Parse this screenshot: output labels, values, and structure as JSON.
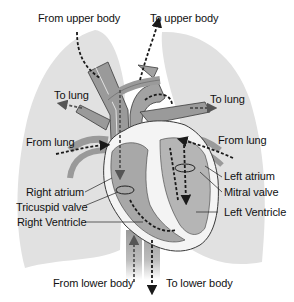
{
  "diagram": {
    "title": "",
    "colors": {
      "background": "#ffffff",
      "lung": "#e1e1e1",
      "vessel": "#9a9a9a",
      "heart_chamber": "#a8a8a8",
      "heart_wall": "#f4f4f4",
      "outline": "#3a3a3a",
      "arrow": "#1a1a1a",
      "text": "#111111"
    },
    "labels": {
      "from_upper_body": "From upper body",
      "to_upper_body": "To upper body",
      "to_lung_left": "To lung",
      "to_lung_right": "To lung",
      "from_lung_left": "From lung",
      "from_lung_right": "From lung",
      "right_atrium": "Right atrium",
      "tricuspid_valve": "Tricuspid valve",
      "right_ventricle": "Right Ventricle",
      "left_atrium": "Left atrium",
      "mitral_valve": "Mitral valve",
      "left_ventricle": "Left Ventricle",
      "from_lower_body": "From lower body",
      "to_lower_body": "To lower body"
    },
    "nodes": [
      {
        "id": "upper-body",
        "label": "Upper body"
      },
      {
        "id": "lower-body",
        "label": "Lower body"
      },
      {
        "id": "right-atrium",
        "label": "Right atrium"
      },
      {
        "id": "tricuspid-valve",
        "label": "Tricuspid valve"
      },
      {
        "id": "right-ventricle",
        "label": "Right Ventricle"
      },
      {
        "id": "lungs",
        "label": "Lung"
      },
      {
        "id": "left-atrium",
        "label": "Left atrium"
      },
      {
        "id": "mitral-valve",
        "label": "Mitral valve"
      },
      {
        "id": "left-ventricle",
        "label": "Left Ventricle"
      }
    ],
    "edges": [
      {
        "from": "upper-body",
        "to": "right-atrium",
        "label": "From upper body"
      },
      {
        "from": "lower-body",
        "to": "right-atrium",
        "label": "From lower body"
      },
      {
        "from": "right-atrium",
        "to": "right-ventricle",
        "via": "tricuspid-valve"
      },
      {
        "from": "right-ventricle",
        "to": "lungs",
        "label": "To lung"
      },
      {
        "from": "lungs",
        "to": "left-atrium",
        "label": "From lung"
      },
      {
        "from": "left-atrium",
        "to": "left-ventricle",
        "via": "mitral-valve"
      },
      {
        "from": "left-ventricle",
        "to": "upper-body",
        "label": "To upper body"
      },
      {
        "from": "left-ventricle",
        "to": "lower-body",
        "label": "To lower body"
      }
    ]
  }
}
